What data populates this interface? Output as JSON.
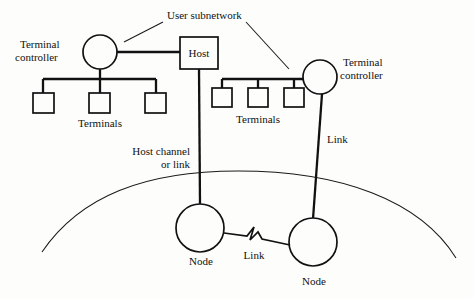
{
  "figure": {
    "kind": "network-topology-diagram",
    "background_color": "#fdfdfc",
    "ink_color": "#111111"
  },
  "labels": {
    "user_subnetwork": "User subnetwork",
    "terminal_controller_left_line1": "Terminal",
    "terminal_controller_left_line2": "controller",
    "terminal_controller_right_line1": "Terminal",
    "terminal_controller_right_line2": "controller",
    "host": "Host",
    "terminals_left": "Terminals",
    "terminals_right": "Terminals",
    "host_channel_line1": "Host channel",
    "host_channel_line2": "or link",
    "link_right": "Link",
    "link_bottom": "Link",
    "node_left": "Node",
    "node_right": "Node"
  },
  "nodes": {
    "terminal_controller_left": {
      "cx": 100,
      "cy": 52,
      "r": 17
    },
    "terminal_controller_right": {
      "cx": 320,
      "cy": 77,
      "r": 17
    },
    "host_box": {
      "x": 180,
      "y": 37,
      "w": 38,
      "h": 32
    },
    "node_left": {
      "cx": 200,
      "cy": 228,
      "r": 24
    },
    "node_right": {
      "cx": 313,
      "cy": 242,
      "r": 24
    },
    "terminals_left": [
      {
        "x": 33,
        "y": 93,
        "w": 21,
        "h": 20
      },
      {
        "x": 89,
        "y": 93,
        "w": 21,
        "h": 20
      },
      {
        "x": 145,
        "y": 93,
        "w": 21,
        "h": 20
      }
    ],
    "terminals_right": [
      {
        "x": 212,
        "y": 88,
        "w": 20,
        "h": 19
      },
      {
        "x": 248,
        "y": 88,
        "w": 20,
        "h": 19
      },
      {
        "x": 284,
        "y": 88,
        "w": 20,
        "h": 19
      }
    ]
  },
  "connections": [
    {
      "name": "controller-left-to-host",
      "from": "terminal_controller_left",
      "to": "host_box"
    },
    {
      "name": "controller-left-to-terminal-bus",
      "from": "terminal_controller_left",
      "to": "terminals_left"
    },
    {
      "name": "host-to-node-left",
      "from": "host_box",
      "to": "node_left",
      "label": "Host channel or link"
    },
    {
      "name": "controller-right-to-terminal-bus",
      "from": "terminal_controller_right",
      "to": "terminals_right"
    },
    {
      "name": "controller-right-to-node-right",
      "from": "terminal_controller_right",
      "to": "node_right",
      "label": "Link"
    },
    {
      "name": "node-left-to-node-right",
      "from": "node_left",
      "to": "node_right",
      "label": "Link",
      "style": "zigzag"
    }
  ],
  "subnetwork_boundary": {
    "name": "communication-subnetwork-arc",
    "description": "large arc separating user subnetwork from node network"
  }
}
